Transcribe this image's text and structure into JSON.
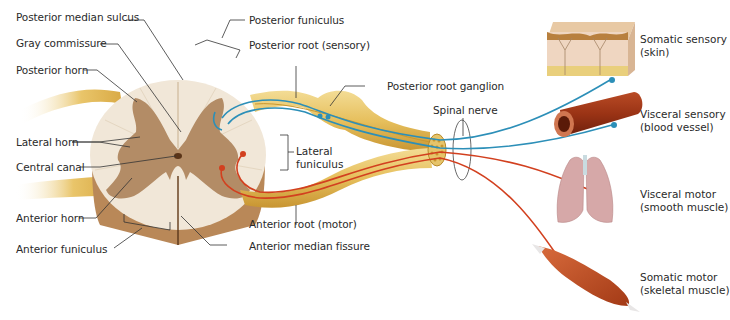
{
  "diagram": {
    "colors": {
      "white_matter": "#f1e7d8",
      "gray_matter": "#b38c66",
      "cord_side": "#b98858",
      "nerve": "#e7c268",
      "nerve_dark": "#c9972f",
      "sensory_fiber": "#2c8fb8",
      "motor_fiber": "#d2401f",
      "leader_line": "#333333"
    },
    "left_labels": {
      "posterior_median_sulcus": "Posterior median sulcus",
      "gray_commissure": "Gray commissure",
      "posterior_horn": "Posterior horn",
      "lateral_horn": "Lateral horn",
      "central_canal": "Central canal",
      "anterior_horn": "Anterior horn",
      "anterior_funiculus": "Anterior funiculus"
    },
    "center_labels": {
      "posterior_funiculus": "Posterior funiculus",
      "posterior_root": "Posterior root (sensory)",
      "posterior_root_ganglion": "Posterior root ganglion",
      "lateral_funiculus_line1": "Lateral",
      "lateral_funiculus_line2": "funiculus",
      "anterior_root": "Anterior root (motor)",
      "anterior_median_fissure": "Anterior median fissure",
      "spinal_nerve": "Spinal nerve"
    },
    "targets": [
      {
        "line1": "Somatic sensory",
        "line2": "(skin)",
        "fiber": "sensory"
      },
      {
        "line1": "Visceral sensory",
        "line2": "(blood vessel)",
        "fiber": "sensory"
      },
      {
        "line1": "Visceral motor",
        "line2": "(smooth muscle)",
        "fiber": "motor"
      },
      {
        "line1": "Somatic motor",
        "line2": "(skeletal muscle)",
        "fiber": "motor"
      }
    ]
  }
}
